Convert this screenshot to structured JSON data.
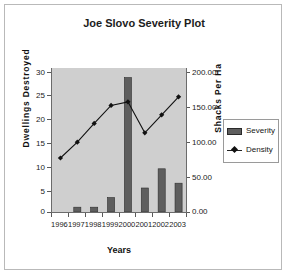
{
  "chart_data": {
    "type": "bar",
    "title": "Joe Slovo Severity Plot",
    "xlabel": "Years",
    "ylabel": "Dwellings Destroyed",
    "y2label": "Shacks Per Ha",
    "categories": [
      "1996",
      "1997",
      "1998",
      "1999",
      "2000",
      "2001",
      "2002",
      "2003"
    ],
    "series": [
      {
        "name": "Severity",
        "kind": "bar",
        "axis": "left",
        "color": "#5e5e5e",
        "values": [
          0,
          1,
          1,
          3,
          28,
          5,
          9,
          6
        ]
      },
      {
        "name": "Density",
        "kind": "line",
        "axis": "right",
        "color": "#111111",
        "marker": "diamond",
        "values": [
          75,
          97,
          123,
          148,
          153,
          110,
          135,
          160
        ]
      }
    ],
    "ylim": [
      0,
      30
    ],
    "yticks": [
      "0",
      "5",
      "10",
      "15",
      "20",
      "25",
      "30"
    ],
    "y2lim": [
      0,
      200
    ],
    "y2ticks": [
      "0.00",
      "50.00",
      "100.00",
      "150.00",
      "200.00"
    ],
    "grid": false,
    "legend_position": "right",
    "plot_background": "#cfcfcf"
  }
}
